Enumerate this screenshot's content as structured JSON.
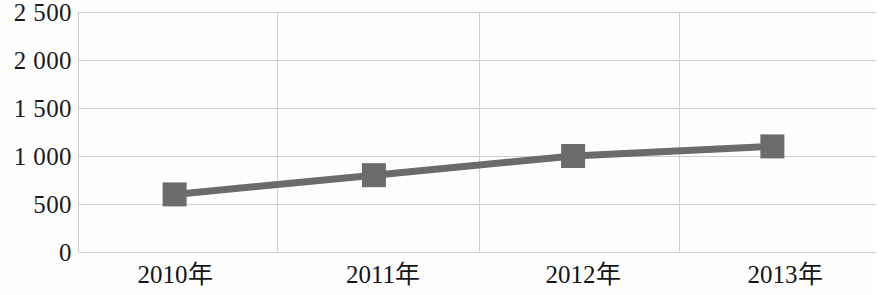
{
  "chart_data": {
    "type": "line",
    "title": "",
    "subtitle": "",
    "xlabel": "",
    "ylabel": "",
    "categories": [
      "2010年",
      "2011年",
      "2012年",
      "2013年"
    ],
    "values": [
      600,
      800,
      1000,
      1100
    ],
    "series": [
      {
        "name": "",
        "values": [
          600,
          800,
          1000,
          1100
        ]
      }
    ],
    "ylim": [
      0,
      2500
    ],
    "ytick_labels": [
      "2 500",
      "2 000",
      "1 500",
      "1 000",
      "500",
      "0"
    ],
    "ytick_values": [
      2500,
      2000,
      1500,
      1000,
      500,
      0
    ],
    "ystep": 500,
    "grid": {
      "horizontal": true,
      "vertical": true,
      "color": "#cfcfcf"
    },
    "legend": {
      "visible": false,
      "position": "none",
      "entries": []
    },
    "marker": {
      "shape": "square",
      "size": 24,
      "color": "#6b6b6b"
    },
    "line": {
      "color": "#6b6b6b",
      "width": 7
    },
    "annotations": []
  },
  "colors": {
    "series": "#6b6b6b",
    "grid": "#cfcfcf",
    "axis": "#c9c9c9",
    "text": "#1a1a1a",
    "background": "#fefefe"
  }
}
